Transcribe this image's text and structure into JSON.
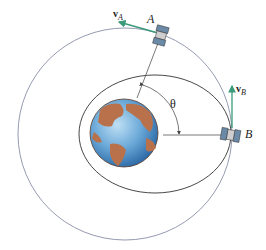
{
  "diagram": {
    "labels": {
      "point_a": "A",
      "point_b": "B",
      "angle": "θ",
      "velocity_a_symbol": "v",
      "velocity_a_sub": "A",
      "velocity_b_symbol": "v",
      "velocity_b_sub": "B"
    },
    "colors": {
      "outer_orbit": "#8a8fa8",
      "inner_orbit": "#333333",
      "velocity_vector": "#3a9a7a",
      "earth_ocean": "#5a9ad0",
      "earth_land": "#b8714a",
      "radial_line": "#555555"
    },
    "elements": [
      "outer circular orbit",
      "elliptical orbit",
      "earth",
      "satellite A",
      "satellite B",
      "velocity vector vA",
      "velocity vector vB",
      "radial line to A",
      "radial line to B",
      "angle arc θ"
    ]
  }
}
